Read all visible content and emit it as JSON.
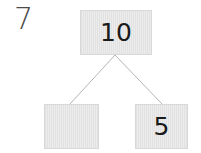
{
  "problem": {
    "number": "7"
  },
  "number_bond": {
    "whole": "10",
    "parts": [
      {
        "value": ""
      },
      {
        "value": "5"
      }
    ]
  },
  "colors": {
    "box_fill": "#e6e6e6",
    "connector": "#b5b5b5",
    "text": "#1a1a1a"
  }
}
